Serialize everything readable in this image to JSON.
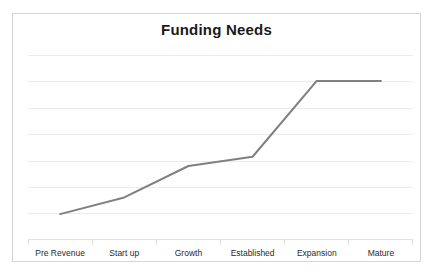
{
  "chart_data": {
    "type": "line",
    "title": "Funding Needs",
    "xlabel": "",
    "ylabel": "",
    "categories": [
      "Pre Revenue",
      "Start up",
      "Growth",
      "Established",
      "Expansion",
      "Mature"
    ],
    "series": [
      {
        "name": "Funding Needs",
        "values": [
          0.14,
          0.23,
          0.4,
          0.45,
          0.86,
          0.86
        ],
        "color": "#808080"
      }
    ],
    "ylim": [
      0,
      1
    ],
    "yticks": [
      0,
      0.143,
      0.286,
      0.429,
      0.571,
      0.714,
      0.857,
      1.0
    ],
    "ytick_labels": [],
    "grid": true,
    "legend": false,
    "legend_position": "none",
    "axis_line_color": "#e2e2e3",
    "gridline_color": "#ececed",
    "border_color": "#d4d4d4",
    "background": "#ffffff"
  },
  "chart": {
    "title": "Funding Needs",
    "categories": [
      {
        "label": "Pre Revenue"
      },
      {
        "label": "Start up"
      },
      {
        "label": "Growth"
      },
      {
        "label": "Established"
      },
      {
        "label": "Expansion"
      },
      {
        "label": "Mature"
      }
    ]
  }
}
